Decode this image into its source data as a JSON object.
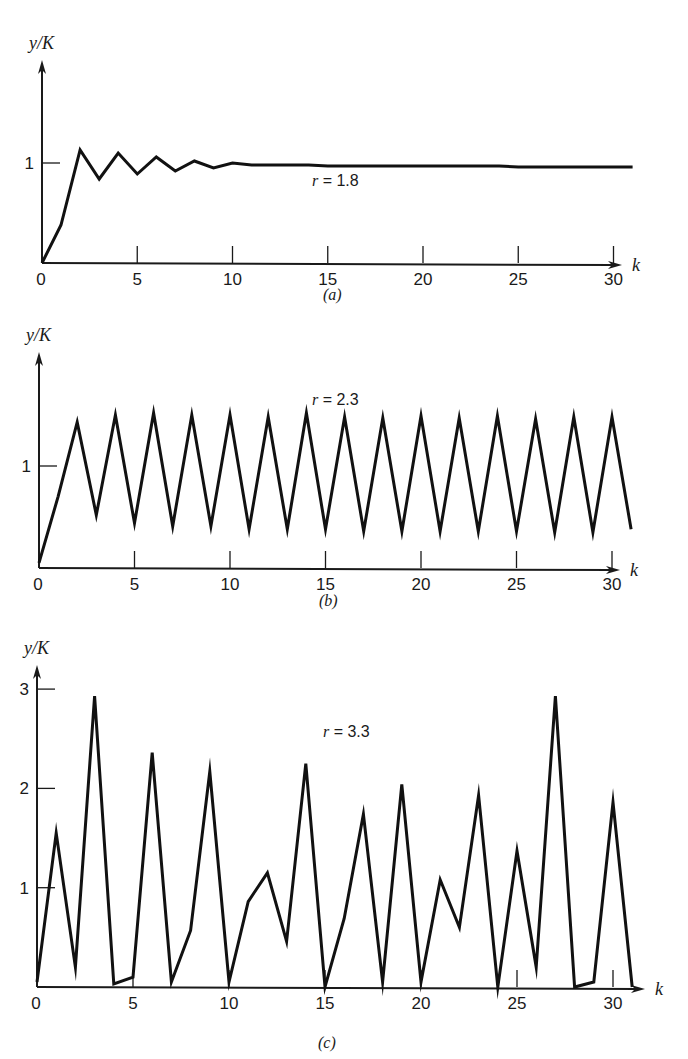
{
  "chart_data": [
    {
      "panel": "a",
      "type": "line",
      "caption": "(a)",
      "annotation": "r = 1.8",
      "annotation_parts": {
        "var": "r",
        "eq": " = 1.8"
      },
      "ylabel": "y/K",
      "xlabel": "k",
      "x_ticks": [
        0,
        5,
        10,
        15,
        20,
        25,
        30
      ],
      "y_ticks": [
        1
      ],
      "xlim": [
        0,
        31.5
      ],
      "grid": false,
      "x": [
        0,
        1,
        2,
        3,
        4,
        5,
        6,
        7,
        8,
        9,
        10,
        11,
        12,
        13,
        14,
        15,
        16,
        17,
        18,
        19,
        20,
        21,
        22,
        23,
        24,
        25,
        26,
        27,
        28,
        29,
        30,
        31
      ],
      "values": [
        0.0,
        0.38,
        1.13,
        0.84,
        1.1,
        0.89,
        1.06,
        0.92,
        1.02,
        0.95,
        1.0,
        0.98,
        0.98,
        0.98,
        0.98,
        0.97,
        0.97,
        0.97,
        0.97,
        0.97,
        0.97,
        0.97,
        0.97,
        0.97,
        0.97,
        0.96,
        0.96,
        0.96,
        0.96,
        0.96,
        0.96,
        0.96
      ],
      "layout": {
        "x0": 42,
        "y0": 263,
        "px_per_k": 19.05,
        "px_per_unit": 100,
        "y_axis_top": 60,
        "x_axis_end": 622
      }
    },
    {
      "panel": "b",
      "type": "line",
      "caption": "(b)",
      "annotation": "r = 2.3",
      "annotation_parts": {
        "var": "r",
        "eq": " = 2.3"
      },
      "ylabel": "y/K",
      "xlabel": "k",
      "x_ticks": [
        0,
        5,
        10,
        15,
        20,
        25,
        30
      ],
      "y_ticks": [
        1
      ],
      "xlim": [
        0,
        31.5
      ],
      "grid": false,
      "x": [
        0,
        1,
        2,
        3,
        4,
        5,
        6,
        7,
        8,
        9,
        10,
        11,
        12,
        13,
        14,
        15,
        16,
        17,
        18,
        19,
        20,
        21,
        22,
        23,
        24,
        25,
        26,
        27,
        28,
        29,
        30,
        31
      ],
      "values": [
        0.05,
        0.7,
        1.43,
        0.52,
        1.5,
        0.44,
        1.52,
        0.41,
        1.5,
        0.41,
        1.5,
        0.38,
        1.48,
        0.38,
        1.52,
        0.38,
        1.48,
        0.36,
        1.47,
        0.36,
        1.49,
        0.36,
        1.47,
        0.36,
        1.49,
        0.36,
        1.46,
        0.35,
        1.48,
        0.35,
        1.48,
        0.38
      ],
      "layout": {
        "x0": 39,
        "y0": 568,
        "px_per_k": 19.1,
        "px_per_unit": 102,
        "y_axis_top": 352,
        "x_axis_end": 620
      }
    },
    {
      "panel": "c",
      "type": "line",
      "caption": "(c)",
      "annotation": "r = 3.3",
      "annotation_parts": {
        "var": "r",
        "eq": " = 3.3"
      },
      "ylabel": "y/K",
      "xlabel": "k",
      "x_ticks": [
        0,
        5,
        10,
        15,
        20,
        25,
        30
      ],
      "y_ticks": [
        1,
        2,
        3
      ],
      "xlim": [
        0,
        31.5
      ],
      "ylim": [
        0,
        3.2
      ],
      "grid": false,
      "x": [
        0,
        1,
        2,
        3,
        4,
        5,
        6,
        7,
        8,
        9,
        10,
        11,
        12,
        13,
        14,
        15,
        16,
        17,
        18,
        19,
        20,
        21,
        22,
        23,
        24,
        25,
        26,
        27,
        28,
        29,
        30,
        31
      ],
      "values": [
        0.05,
        1.55,
        0.2,
        2.93,
        0.03,
        0.1,
        2.36,
        0.05,
        0.57,
        2.17,
        0.05,
        0.86,
        1.15,
        0.46,
        2.25,
        0.0,
        0.69,
        1.74,
        0.05,
        2.04,
        0.05,
        1.08,
        0.6,
        1.93,
        0.0,
        1.37,
        0.2,
        2.93,
        0.0,
        0.05,
        1.86,
        0.0
      ],
      "layout": {
        "x0": 37,
        "y0": 987,
        "px_per_k": 19.2,
        "px_per_unit": 99.3,
        "y_axis_top": 665,
        "x_axis_end": 645
      }
    }
  ]
}
